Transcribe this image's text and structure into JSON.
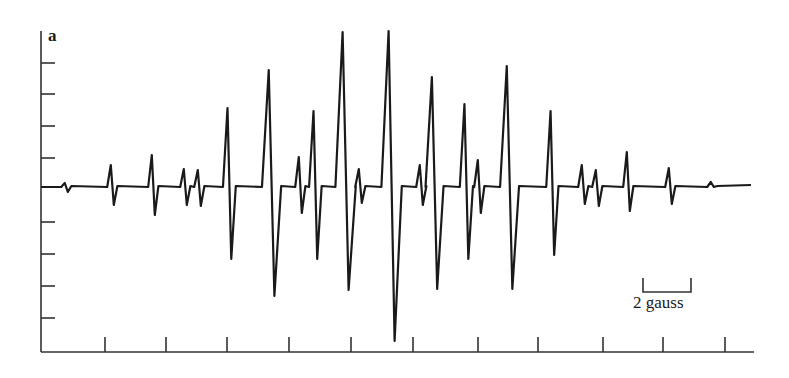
{
  "chart_data": {
    "type": "line",
    "title": "",
    "panel_label": "a",
    "xlabel": "",
    "ylabel": "",
    "grid": false,
    "legend": null,
    "scale_bar": {
      "label": "2 gauss",
      "x_start_px": 643,
      "x_end_px": 691,
      "y_px": 292
    },
    "axes": {
      "y_axis": {
        "x_px": 41,
        "top_px": 31,
        "bottom_px": 352,
        "ticks_px": [
          63,
          94,
          126,
          158,
          222,
          254,
          286,
          318
        ],
        "tick_labels": []
      },
      "x_axis": {
        "y_px": 352,
        "left_px": 41,
        "right_px": 754,
        "ticks_px": [
          105,
          166,
          227,
          289,
          351,
          413,
          478,
          538,
          603,
          663,
          725
        ],
        "tick_labels": []
      }
    },
    "baseline_y_px": 187,
    "lines": [
      {
        "x": 66,
        "up": 183,
        "down": 192
      },
      {
        "x": 112,
        "up": 165,
        "down": 205
      },
      {
        "x": 153,
        "up": 155,
        "down": 215
      },
      {
        "x": 185,
        "up": 169,
        "down": 205
      },
      {
        "x": 199,
        "up": 170,
        "down": 206
      },
      {
        "x": 229,
        "up": 108,
        "down": 259
      },
      {
        "x": 271,
        "up": 70,
        "down": 296
      },
      {
        "x": 300,
        "up": 157,
        "down": 213
      },
      {
        "x": 315,
        "up": 111,
        "down": 259
      },
      {
        "x": 345,
        "up": 32,
        "down": 290
      },
      {
        "x": 360,
        "up": 169,
        "down": 203
      },
      {
        "x": 391,
        "up": 31,
        "down": 341
      },
      {
        "x": 421,
        "up": 165,
        "down": 205
      },
      {
        "x": 434,
        "up": 77,
        "down": 289
      },
      {
        "x": 466,
        "up": 104,
        "down": 259
      },
      {
        "x": 479,
        "up": 160,
        "down": 213
      },
      {
        "x": 509,
        "up": 66,
        "down": 289
      },
      {
        "x": 552,
        "up": 111,
        "down": 255
      },
      {
        "x": 583,
        "up": 165,
        "down": 204
      },
      {
        "x": 597,
        "up": 170,
        "down": 206
      },
      {
        "x": 628,
        "up": 152,
        "down": 211
      },
      {
        "x": 670,
        "up": 168,
        "down": 204
      },
      {
        "x": 712,
        "up": 182,
        "down": 187
      }
    ],
    "trace_x_range_px": [
      41,
      751
    ]
  }
}
